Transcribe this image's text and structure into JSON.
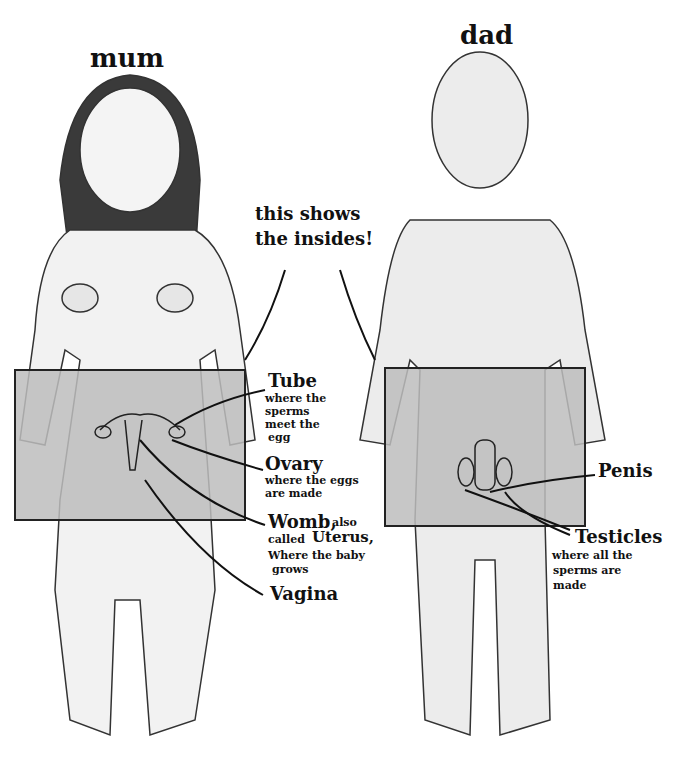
{
  "figures": {
    "mum": {
      "title": "mum"
    },
    "dad": {
      "title": "dad"
    }
  },
  "callout": {
    "line1": "this shows",
    "line2": "the insides!"
  },
  "female_labels": {
    "tube": {
      "name": "Tube",
      "desc1": "where the",
      "desc2": "sperms",
      "desc3": "meet the",
      "desc4": "egg"
    },
    "ovary": {
      "name": "Ovary",
      "desc1": "where the eggs",
      "desc2": "are made"
    },
    "womb": {
      "name": "Womb,",
      "also": "also",
      "desc1": "called",
      "alt": "Uterus,",
      "desc2": "Where the baby",
      "desc3": "grows"
    },
    "vagina": {
      "name": "Vagina"
    }
  },
  "male_labels": {
    "penis": {
      "name": "Penis"
    },
    "testicles": {
      "name": "Testicles",
      "desc1": "where all the",
      "desc2": "sperms are",
      "desc3": "made"
    }
  },
  "colors": {
    "skin_panel": "#bdbdbd",
    "line": "#222222",
    "body_fill": "#efefef"
  }
}
